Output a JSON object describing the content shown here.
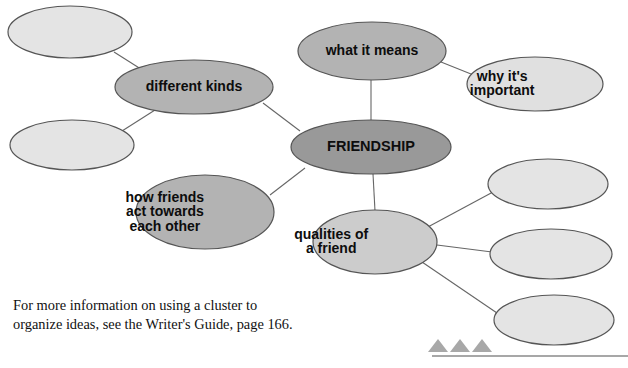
{
  "diagram": {
    "type": "cluster-map",
    "title_node": "FRIENDSHIP",
    "background": "#ffffff",
    "colors": {
      "center_fill": "#999999",
      "primary_fill": "#b3b3b3",
      "secondary_fill": "#cccccc",
      "empty_fill": "#e4e4e4",
      "stroke": "#555555",
      "line": "#666666",
      "text": "#0d0d0d",
      "triangle": "#a8a8a8",
      "rule": "#8a8a8a"
    },
    "nodes": [
      {
        "id": "n-empty-tl",
        "label": "",
        "cx": 70,
        "cy": 32,
        "rx": 62,
        "ry": 26,
        "fill": "#e4e4e4",
        "lines": []
      },
      {
        "id": "n-empty-bl",
        "label": "",
        "cx": 72,
        "cy": 145,
        "rx": 62,
        "ry": 25,
        "fill": "#e4e4e4",
        "lines": []
      },
      {
        "id": "n-different-kinds",
        "label": "different kinds",
        "cx": 194,
        "cy": 87,
        "rx": 79,
        "ry": 27,
        "fill": "#b3b3b3",
        "lines": [
          "different kinds"
        ]
      },
      {
        "id": "n-what-it-means",
        "label": "what it means",
        "cx": 372,
        "cy": 51,
        "rx": 74,
        "ry": 29,
        "fill": "#b3b3b3",
        "lines": [
          "what it means"
        ]
      },
      {
        "id": "n-why-important",
        "label": "why it's important",
        "cx": 535,
        "cy": 84,
        "rx": 68,
        "ry": 27,
        "fill": "#e0e0e0",
        "lines": [
          "why it's",
          "important"
        ]
      },
      {
        "id": "n-friendship",
        "label": "FRIENDSHIP",
        "cx": 371,
        "cy": 147,
        "rx": 80,
        "ry": 27,
        "fill": "#999999",
        "lines": [
          "FRIENDSHIP"
        ]
      },
      {
        "id": "n-how-friends-act",
        "label": "how friends act towards each other",
        "cx": 205,
        "cy": 212,
        "rx": 69,
        "ry": 37,
        "fill": "#b3b3b3",
        "lines": [
          "how friends",
          "act towards",
          "each other"
        ]
      },
      {
        "id": "n-qualities",
        "label": "qualities of a friend",
        "cx": 375,
        "cy": 242,
        "rx": 62,
        "ry": 32,
        "fill": "#cccccc",
        "lines": [
          "qualities of",
          "a friend"
        ]
      },
      {
        "id": "n-empty-r1",
        "label": "",
        "cx": 548,
        "cy": 184,
        "rx": 60,
        "ry": 25,
        "fill": "#e4e4e4",
        "lines": []
      },
      {
        "id": "n-empty-r2",
        "label": "",
        "cx": 551,
        "cy": 254,
        "rx": 61,
        "ry": 25,
        "fill": "#e4e4e4",
        "lines": []
      },
      {
        "id": "n-empty-r3",
        "label": "",
        "cx": 554,
        "cy": 320,
        "rx": 60,
        "ry": 25,
        "fill": "#e4e4e4",
        "lines": []
      }
    ],
    "connectors": [
      {
        "id": "c-tl-kinds",
        "from": "n-empty-tl",
        "to": "n-different-kinds",
        "x1": 114,
        "y1": 52,
        "x2": 144,
        "y2": 71
      },
      {
        "id": "c-bl-kinds",
        "from": "n-empty-bl",
        "to": "n-different-kinds",
        "x1": 122,
        "y1": 131,
        "x2": 155,
        "y2": 110
      },
      {
        "id": "c-kinds-friendship",
        "from": "n-different-kinds",
        "to": "n-friendship",
        "x1": 263,
        "y1": 103,
        "x2": 300,
        "y2": 131
      },
      {
        "id": "c-means-friendship",
        "from": "n-what-it-means",
        "to": "n-friendship",
        "x1": 371,
        "y1": 80,
        "x2": 371,
        "y2": 121
      },
      {
        "id": "c-means-why",
        "from": "n-what-it-means",
        "to": "n-why-important",
        "x1": 441,
        "y1": 62,
        "x2": 476,
        "y2": 76
      },
      {
        "id": "c-how-friendship",
        "from": "n-how-friends-act",
        "to": "n-friendship",
        "x1": 270,
        "y1": 195,
        "x2": 305,
        "y2": 168
      },
      {
        "id": "c-friendship-qual",
        "from": "n-friendship",
        "to": "n-qualities",
        "x1": 373,
        "y1": 174,
        "x2": 375,
        "y2": 211
      },
      {
        "id": "c-qual-r1",
        "from": "n-qualities",
        "to": "n-empty-r1",
        "x1": 426,
        "y1": 228,
        "x2": 493,
        "y2": 192
      },
      {
        "id": "c-qual-r2",
        "from": "n-qualities",
        "to": "n-empty-r2",
        "x1": 437,
        "y1": 245,
        "x2": 492,
        "y2": 252
      },
      {
        "id": "c-qual-r3",
        "from": "n-qualities",
        "to": "n-empty-r3",
        "x1": 422,
        "y1": 262,
        "x2": 497,
        "y2": 313
      }
    ],
    "markers": {
      "triangles": [
        {
          "id": "triangle-1",
          "cx": 438,
          "base_y": 352,
          "half_w": 10,
          "height": 13
        },
        {
          "id": "triangle-2",
          "cx": 460,
          "base_y": 352,
          "half_w": 10,
          "height": 13
        },
        {
          "id": "triangle-3",
          "cx": 482,
          "base_y": 352,
          "half_w": 10,
          "height": 13
        }
      ],
      "rule": {
        "id": "bottom-rule",
        "x1": 432,
        "y1": 356,
        "x2": 628,
        "y2": 356
      }
    }
  },
  "caption": {
    "text": "For more information on using a cluster to\norganize ideas, see the Writer's Guide, page 166."
  }
}
